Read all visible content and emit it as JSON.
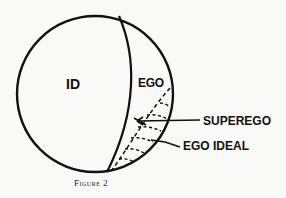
{
  "diagram": {
    "regions": {
      "id": "ID",
      "ego": "EGO"
    },
    "callouts": {
      "superego": "SUPEREGO",
      "ego_ideal": "EGO IDEAL"
    },
    "caption": "Figure 2"
  },
  "colors": {
    "background": "#f9f9f7",
    "ink": "#111111"
  }
}
